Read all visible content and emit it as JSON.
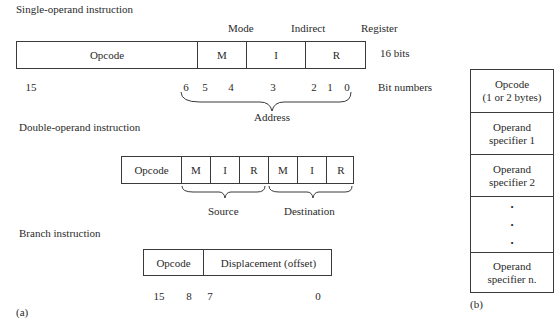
{
  "single": {
    "title": "Single-operand instruction",
    "headers": [
      "Mode",
      "Indirect",
      "Register"
    ],
    "fields": [
      "Opcode",
      "M",
      "I",
      "R"
    ],
    "size_label": "16 bits",
    "bits": [
      "15",
      "6",
      "5",
      "4",
      "3",
      "2",
      "1",
      "0"
    ],
    "bits_label": "Bit numbers",
    "brace_label": "Address"
  },
  "double": {
    "title": "Double-operand instruction",
    "fields": [
      "Opcode",
      "M",
      "I",
      "R",
      "M",
      "I",
      "R"
    ],
    "source_label": "Source",
    "destination_label": "Destination"
  },
  "branch": {
    "title": "Branch instruction",
    "fields": [
      "Opcode",
      "Displacement (offset)"
    ],
    "bits": [
      "15",
      "8",
      "7",
      "0"
    ]
  },
  "panel_a_label": "(a)",
  "panel_b_label": "(b)",
  "format_b": {
    "cells": [
      {
        "line1": "Opcode",
        "line2": "(1 or 2 bytes)"
      },
      {
        "line1": "Operand",
        "line2": "specifier 1"
      },
      {
        "line1": "Operand",
        "line2": "specifier 2"
      },
      {
        "line1": "•",
        "line2": "•",
        "line3": "•"
      },
      {
        "line1": "Operand",
        "line2": "specifier n."
      }
    ]
  }
}
